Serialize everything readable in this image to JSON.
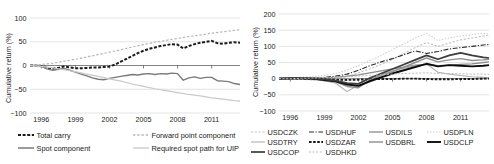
{
  "figure": {
    "title": "",
    "panels": [
      "carry-decomposition",
      "currency-cumulative-returns"
    ]
  },
  "chart_data": [
    {
      "id": "left",
      "type": "line",
      "title": "",
      "xlabel": "",
      "ylabel": "Cumulative return (%)",
      "xlim": [
        1995.0,
        2013.5
      ],
      "ylim": [
        -100,
        100
      ],
      "yticks": [
        100,
        50,
        0,
        -50,
        -100
      ],
      "ytick_labels": [
        "100",
        "50",
        "0",
        "−50",
        "−100"
      ],
      "xticks": [
        1996,
        1999,
        2002,
        2005,
        2008,
        2011
      ],
      "xtick_labels": [
        "1996",
        "1999",
        "2002",
        "2005",
        "2008",
        "2011"
      ],
      "grid": true,
      "legend_position": "below",
      "series": [
        {
          "name": "Total carry",
          "color": "#1a1a1a",
          "width": 2.0,
          "dash": "3,1.6",
          "x": [
            1995.0,
            1995.5,
            1996.0,
            1996.5,
            1997.0,
            1997.5,
            1998.0,
            1998.5,
            1999.0,
            1999.5,
            2000.0,
            2000.5,
            2001.0,
            2001.5,
            2002.0,
            2002.5,
            2003.0,
            2003.5,
            2004.0,
            2004.5,
            2005.0,
            2005.5,
            2006.0,
            2006.5,
            2007.0,
            2007.5,
            2008.0,
            2008.5,
            2009.0,
            2009.5,
            2010.0,
            2010.5,
            2011.0,
            2011.5,
            2012.0,
            2012.5,
            2013.0,
            2013.5
          ],
          "y": [
            0,
            0,
            -1,
            -5,
            -7,
            -5,
            -2,
            -4,
            -6,
            -6,
            -5,
            -4,
            -4,
            -3,
            -2,
            2,
            8,
            14,
            20,
            26,
            31,
            35,
            38,
            41,
            43,
            45,
            44,
            36,
            41,
            45,
            48,
            50,
            52,
            47,
            46,
            48,
            49,
            48
          ]
        },
        {
          "name": "Spot component",
          "color": "#7a7a7a",
          "width": 1.4,
          "dash": "none",
          "x": [
            1995.0,
            1995.5,
            1996.0,
            1996.5,
            1997.0,
            1997.5,
            1998.0,
            1998.5,
            1999.0,
            1999.5,
            2000.0,
            2000.5,
            2001.0,
            2001.5,
            2002.0,
            2002.5,
            2003.0,
            2003.5,
            2004.0,
            2004.5,
            2005.0,
            2005.5,
            2006.0,
            2006.5,
            2007.0,
            2007.5,
            2008.0,
            2008.5,
            2009.0,
            2009.5,
            2010.0,
            2010.5,
            2011.0,
            2011.5,
            2012.0,
            2012.5,
            2013.0,
            2013.5
          ],
          "y": [
            0,
            0,
            -2,
            -7,
            -10,
            -8,
            -6,
            -10,
            -14,
            -18,
            -22,
            -26,
            -29,
            -30,
            -27,
            -25,
            -23,
            -21,
            -19,
            -20,
            -18,
            -17,
            -19,
            -17,
            -18,
            -16,
            -17,
            -31,
            -26,
            -24,
            -27,
            -25,
            -25,
            -32,
            -33,
            -34,
            -38,
            -40
          ]
        },
        {
          "name": "Forward point component",
          "color": "#b8b8b8",
          "width": 1.2,
          "dash": "2.4,1.8",
          "x": [
            1995.0,
            1996.0,
            1997.0,
            1998.0,
            1999.0,
            2000.0,
            2001.0,
            2002.0,
            2003.0,
            2004.0,
            2005.0,
            2006.0,
            2007.0,
            2008.0,
            2009.0,
            2010.0,
            2011.0,
            2012.0,
            2013.0,
            2013.5
          ],
          "y": [
            0,
            2,
            5,
            9,
            13,
            18,
            23,
            28,
            33,
            39,
            44,
            49,
            53,
            57,
            61,
            64,
            68,
            71,
            74,
            75
          ]
        },
        {
          "name": "Required spot path for UIP",
          "color": "#c9c9c9",
          "width": 1.2,
          "dash": "none",
          "x": [
            1995.0,
            1996.0,
            1997.0,
            1998.0,
            1999.0,
            2000.0,
            2001.0,
            2002.0,
            2003.0,
            2004.0,
            2005.0,
            2006.0,
            2007.0,
            2008.0,
            2009.0,
            2010.0,
            2011.0,
            2012.0,
            2013.0,
            2013.5
          ],
          "y": [
            0,
            -2,
            -5,
            -9,
            -13,
            -18,
            -23,
            -28,
            -33,
            -39,
            -44,
            -49,
            -53,
            -57,
            -61,
            -64,
            -68,
            -71,
            -74,
            -75
          ]
        }
      ]
    },
    {
      "id": "right",
      "type": "line",
      "title": "",
      "xlabel": "",
      "ylabel": "Cumulative return (%)",
      "xlim": [
        1995.0,
        2013.5
      ],
      "ylim": [
        -100,
        200
      ],
      "yticks": [
        200,
        150,
        100,
        50,
        0,
        -50,
        -100
      ],
      "ytick_labels": [
        "200",
        "150",
        "100",
        "50",
        "0",
        "−50",
        "−100"
      ],
      "xticks": [
        1996,
        1999,
        2002,
        2005,
        2008,
        2011
      ],
      "xtick_labels": [
        "1996",
        "1999",
        "2002",
        "2005",
        "2008",
        "2011"
      ],
      "grid": true,
      "legend_position": "below",
      "series": [
        {
          "name": "USDCZK",
          "color": "#c2c2c2",
          "width": 1.1,
          "dash": "2.2,1.6",
          "x": [
            1995,
            1996,
            1997,
            1998,
            1999,
            2000,
            2001,
            2002,
            2003,
            2004,
            2005,
            2006,
            2007,
            2008,
            2009,
            2010,
            2011,
            2012,
            2013,
            2013.5
          ],
          "y": [
            0,
            1,
            -2,
            -4,
            -3,
            0,
            6,
            18,
            30,
            44,
            60,
            78,
            96,
            112,
            100,
            110,
            120,
            126,
            132,
            133
          ]
        },
        {
          "name": "USDHUF",
          "color": "#2b2b2b",
          "width": 1.1,
          "dash": "5,1.6,1.2,1.6",
          "x": [
            1995,
            1996,
            1997,
            1998,
            1999,
            2000,
            2001,
            2002,
            2003,
            2004,
            2005,
            2006,
            2007,
            2008,
            2009,
            2010,
            2011,
            2012,
            2013,
            2013.5
          ],
          "y": [
            0,
            2,
            3,
            2,
            4,
            8,
            14,
            26,
            40,
            52,
            62,
            74,
            86,
            78,
            84,
            92,
            96,
            100,
            104,
            106
          ]
        },
        {
          "name": "USDILS",
          "color": "#8c8c8c",
          "width": 1.3,
          "dash": "none",
          "x": [
            1995,
            1996,
            1997,
            1998,
            1999,
            2000,
            2001,
            2002,
            2003,
            2004,
            2005,
            2006,
            2007,
            2008,
            2009,
            2010,
            2011,
            2012,
            2013,
            2013.5
          ],
          "y": [
            0,
            1,
            2,
            2,
            3,
            5,
            8,
            12,
            18,
            24,
            30,
            36,
            42,
            44,
            40,
            42,
            44,
            46,
            50,
            52
          ]
        },
        {
          "name": "USDPLN",
          "color": "#d2d2d2",
          "width": 1.1,
          "dash": "1.6,1.4",
          "x": [
            1995,
            1996,
            1997,
            1998,
            1999,
            2000,
            2001,
            2002,
            2003,
            2004,
            2005,
            2006,
            2007,
            2008,
            2009,
            2010,
            2011,
            2012,
            2013,
            2013.5
          ],
          "y": [
            0,
            2,
            4,
            6,
            10,
            16,
            26,
            40,
            56,
            72,
            90,
            108,
            126,
            140,
            118,
            126,
            132,
            136,
            140,
            138
          ]
        },
        {
          "name": "USDTRY",
          "color": "#b0b0b0",
          "width": 1.1,
          "dash": "none",
          "x": [
            1995,
            1996,
            1997,
            1998,
            1999,
            2000,
            2001,
            2002,
            2003,
            2004,
            2005,
            2006,
            2007,
            2008,
            2009,
            2010,
            2011,
            2012,
            2013,
            2013.5
          ],
          "y": [
            0,
            0,
            -1,
            -3,
            -6,
            -14,
            -40,
            -20,
            2,
            14,
            24,
            32,
            40,
            46,
            20,
            14,
            10,
            6,
            4,
            3
          ]
        },
        {
          "name": "USDZAR",
          "color": "#1a1a1a",
          "width": 1.9,
          "dash": "2.6,1.5",
          "x": [
            1995,
            1996,
            1997,
            1998,
            1999,
            2000,
            2001,
            2002,
            2003,
            2004,
            2005,
            2006,
            2007,
            2008,
            2009,
            2010,
            2011,
            2012,
            2013,
            2013.5
          ],
          "y": [
            0,
            0,
            0,
            -1,
            -2,
            -3,
            -4,
            -3,
            -2,
            -1,
            -1,
            0,
            0,
            -1,
            -2,
            -2,
            -1,
            -1,
            0,
            0
          ]
        },
        {
          "name": "USDBRL",
          "color": "#8f8f8f",
          "width": 1.4,
          "dash": "none",
          "x": [
            1995,
            1996,
            1997,
            1998,
            1999,
            2000,
            2001,
            2002,
            2003,
            2004,
            2005,
            2006,
            2007,
            2008,
            2009,
            2010,
            2011,
            2012,
            2013,
            2013.5
          ],
          "y": [
            0,
            1,
            2,
            0,
            -6,
            -10,
            -24,
            -28,
            -4,
            10,
            22,
            36,
            50,
            64,
            52,
            58,
            62,
            56,
            58,
            60
          ]
        },
        {
          "name": "USDCLP",
          "color": "#0d0d0d",
          "width": 1.9,
          "dash": "none",
          "x": [
            1995,
            1996,
            1997,
            1998,
            1999,
            2000,
            2001,
            2002,
            2003,
            2004,
            2005,
            2006,
            2007,
            2008,
            2009,
            2010,
            2011,
            2012,
            2013,
            2013.5
          ],
          "y": [
            0,
            1,
            1,
            0,
            -4,
            -8,
            -18,
            -22,
            -8,
            4,
            16,
            26,
            36,
            46,
            38,
            42,
            40,
            38,
            40,
            42
          ]
        },
        {
          "name": "USDCOP",
          "color": "#3d3d3d",
          "width": 1.7,
          "dash": "none",
          "x": [
            1995,
            1996,
            1997,
            1998,
            1999,
            2000,
            2001,
            2002,
            2003,
            2004,
            2005,
            2006,
            2007,
            2008,
            2009,
            2010,
            2011,
            2012,
            2013,
            2013.5
          ],
          "y": [
            0,
            1,
            2,
            1,
            -2,
            -6,
            -14,
            -16,
            2,
            16,
            30,
            44,
            58,
            72,
            60,
            72,
            80,
            72,
            66,
            64
          ]
        },
        {
          "name": "USDHKD",
          "color": "#bdbdbd",
          "width": 1.0,
          "dash": "2.0,1.6",
          "x": [
            1995,
            1996,
            1997,
            1998,
            1999,
            2000,
            2001,
            2002,
            2003,
            2004,
            2005,
            2006,
            2007,
            2008,
            2009,
            2010,
            2011,
            2012,
            2013,
            2013.5
          ],
          "y": [
            0,
            0,
            1,
            2,
            3,
            4,
            6,
            8,
            10,
            12,
            14,
            16,
            17,
            18,
            16,
            16,
            15,
            14,
            14,
            13
          ]
        }
      ]
    }
  ],
  "left_legend": {
    "items": [
      {
        "label": "Total carry",
        "style": "dashed-thick-black",
        "color": "#1a1a1a"
      },
      {
        "label": "Forward point component",
        "style": "dotted-light-gray",
        "color": "#b8b8b8"
      },
      {
        "label": "Spot component",
        "style": "solid-gray",
        "color": "#7a7a7a"
      },
      {
        "label": "Required spot path for UIP",
        "style": "solid-light-gray",
        "color": "#c9c9c9"
      }
    ]
  },
  "right_legend": {
    "items": [
      {
        "label": "USDCZK",
        "color": "#c2c2c2",
        "dash": "2.2,1.6",
        "width": 1.1
      },
      {
        "label": "USDHUF",
        "color": "#2b2b2b",
        "dash": "5,1.6,1.2,1.6",
        "width": 1.1
      },
      {
        "label": "USDILS",
        "color": "#8c8c8c",
        "dash": "none",
        "width": 1.3
      },
      {
        "label": "USDPLN",
        "color": "#d2d2d2",
        "dash": "1.6,1.4",
        "width": 1.1
      },
      {
        "label": "USDTRY",
        "color": "#b0b0b0",
        "dash": "none",
        "width": 1.1
      },
      {
        "label": "USDZAR",
        "color": "#1a1a1a",
        "dash": "2.6,1.5",
        "width": 1.9
      },
      {
        "label": "USDBRL",
        "color": "#8f8f8f",
        "dash": "none",
        "width": 1.4
      },
      {
        "label": "USDCLP",
        "color": "#0d0d0d",
        "dash": "none",
        "width": 1.9
      },
      {
        "label": "USDCOP",
        "color": "#3d3d3d",
        "dash": "none",
        "width": 1.7
      },
      {
        "label": "USDHKD",
        "color": "#bdbdbd",
        "dash": "2.0,1.6",
        "width": 1.0
      }
    ]
  }
}
